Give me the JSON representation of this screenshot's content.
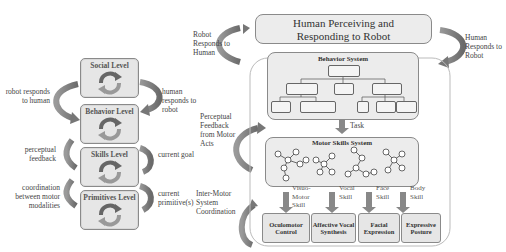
{
  "left_diagram": {
    "levels": [
      {
        "label": "Social Level"
      },
      {
        "label": "Behavior Level"
      },
      {
        "label": "Skills Level"
      },
      {
        "label": "Primitives Level"
      }
    ],
    "left_labels": [
      "robot responds to human",
      "perceptual feedback",
      "coordination between motor modalities"
    ],
    "right_labels": [
      "human responds to robot",
      "current goal",
      "current primitive(s)"
    ]
  },
  "right_diagram": {
    "human_box": {
      "line1": "Human Perceiving and",
      "line2": "Responding to Robot"
    },
    "left_top_label": "Robot Responds to Human",
    "right_top_label": "Human Responds to Robot",
    "behavior_system": {
      "title": "Behavior System"
    },
    "task_label": "Task",
    "perceptual_label": "Perceptual Feedback from Motor Acts",
    "motor_skills_system": {
      "title": "Motor Skills System"
    },
    "inter_motor_label": "Inter-Motor System Coordination",
    "skills": [
      "Visuo-Motor Skill",
      "Vocal Skill",
      "Face Skill",
      "Body Skill"
    ],
    "outputs": [
      {
        "label": "Oculomotor Control"
      },
      {
        "label": "Affective Vocal Synthesis"
      },
      {
        "label": "Facial Expression"
      },
      {
        "label": "Expressive Posture"
      }
    ]
  },
  "colors": {
    "box_fill": "#e6e6e6",
    "border": "#8a8a8a",
    "arrow": "#7a7a7a",
    "text": "#333333"
  }
}
